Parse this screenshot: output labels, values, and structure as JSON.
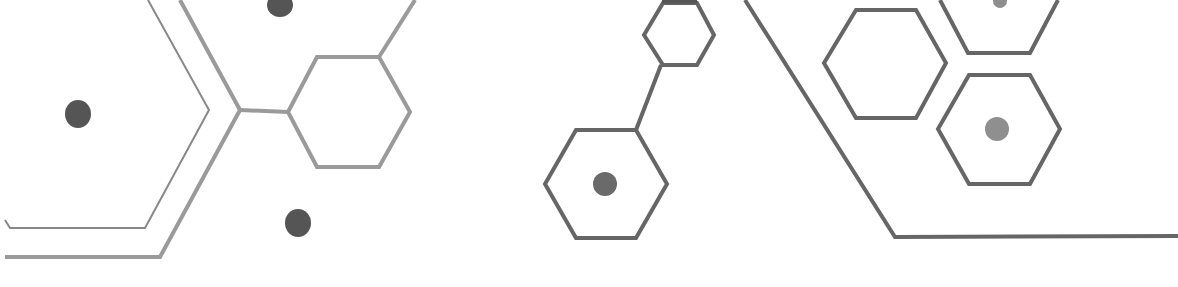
{
  "canvas": {
    "width": 1178,
    "height": 287,
    "background": "#ffffff"
  },
  "colors": {
    "line_light": "#9a9a9a",
    "line_mid": "#888888",
    "line_dark": "#666666",
    "dot_dark": "#555555",
    "dot_mid": "#6a6a6a",
    "dot_light": "#8f8f8f"
  },
  "shapes": {
    "left_group": {
      "thin_bracket": {
        "points": "5,220 10,228 145,228 209,110 148,0",
        "stroke_width": 2
      },
      "thick_bracket": {
        "points": "5,257 160,257 240,110 180,0",
        "stroke_width": 4
      },
      "connector": {
        "points": "240,110 288,112",
        "stroke_width": 4
      },
      "hexagon": {
        "points": "288,112 317,57 379,57 410,112 379,167 317,167",
        "stroke_width": 4
      },
      "branch_line": {
        "points": "379,57 415,0",
        "stroke_width": 4
      },
      "dots": [
        {
          "cx": 78,
          "cy": 114,
          "rx": 13,
          "ry": 14
        },
        {
          "cx": 280,
          "cy": 5,
          "rx": 13,
          "ry": 12
        },
        {
          "cx": 298,
          "cy": 223,
          "rx": 13,
          "ry": 14
        }
      ]
    },
    "middle_group": {
      "small_hexagon": {
        "points": "644,35 663,3 697,3 714,35 697,65 663,65",
        "stroke_width": 4
      },
      "small_hex_top_cap": {
        "points": "662,0 697,0",
        "stroke_width": 7
      },
      "connector": {
        "points": "661,65 636,130",
        "stroke_width": 4
      },
      "large_hexagon": {
        "points": "545,184 576,130 636,130 667,184 636,238 576,238",
        "stroke_width": 4
      },
      "dot": {
        "cx": 605,
        "cy": 184,
        "r": 12
      }
    },
    "right_group": {
      "long_line": {
        "points": "745,0 895,237 1178,236",
        "stroke_width": 4
      },
      "hexagon_a": {
        "points": "824,63 856,10 916,10 946,63 916,118 856,118",
        "stroke_width": 4
      },
      "hexagon_b_partial": {
        "points": "940,0 968,53 1030,53 1058,0",
        "stroke_width": 4
      },
      "hexagon_b_dot": {
        "cx": 1000,
        "cy": 1,
        "r": 7
      },
      "hexagon_c": {
        "points": "938,129 969,75 1030,75 1060,129 1030,184 969,184",
        "stroke_width": 4
      },
      "hexagon_c_dot": {
        "cx": 997,
        "cy": 129,
        "r": 12
      }
    }
  }
}
